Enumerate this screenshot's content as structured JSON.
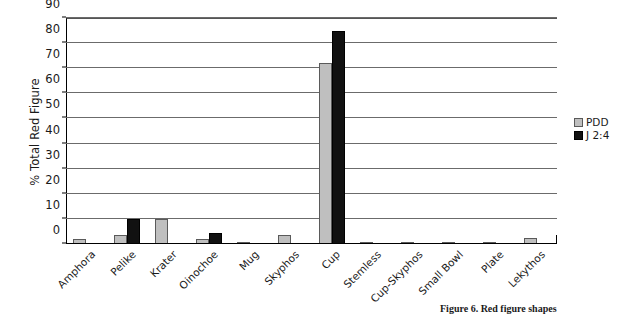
{
  "chart_data": {
    "type": "bar",
    "title": "",
    "xlabel": "",
    "ylabel": "% Total Red Figure",
    "ylim": [
      0,
      90
    ],
    "ytick_step": 10,
    "yticks": [
      0,
      10,
      20,
      30,
      40,
      50,
      60,
      70,
      80,
      90
    ],
    "grid": "horizontal",
    "legend_position": "right",
    "categories": [
      "Amphora",
      "Pelike",
      "Krater",
      "Oinochoe",
      "Mug",
      "Skyphos",
      "Cup",
      "Stemless",
      "Cup-Skyphos",
      "Small Bowl",
      "Plate",
      "Lekythos"
    ],
    "series": [
      {
        "name": "PDD",
        "color": "#bfbfbf",
        "values": [
          2,
          3.5,
          10,
          2,
          1,
          3.5,
          72,
          1,
          1,
          1,
          1,
          2.5
        ]
      },
      {
        "name": "J 2:4",
        "color": "#111111",
        "values": [
          0,
          10,
          0,
          4.5,
          0,
          0,
          85,
          0,
          0,
          0,
          0,
          0
        ]
      }
    ]
  },
  "legend": {
    "items": [
      {
        "label": "PDD",
        "swatch": "sw-pdd"
      },
      {
        "label": "J 2:4",
        "swatch": "sw-j24"
      }
    ]
  },
  "caption": {
    "text": "Figure 6. Red figure shapes"
  }
}
